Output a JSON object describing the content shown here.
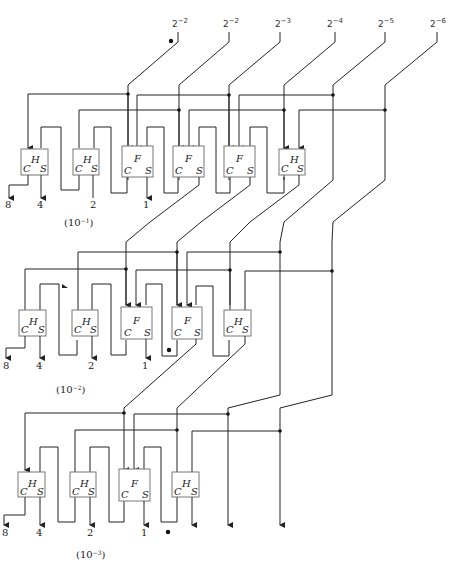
{
  "header": {
    "running_head": ""
  },
  "inputs": [
    {
      "label": "2^-2",
      "base": "2",
      "exp": "−2"
    },
    {
      "label": "2^-2",
      "base": "2",
      "exp": "−2"
    },
    {
      "label": "2^-3",
      "base": "2",
      "exp": "−3"
    },
    {
      "label": "2^-4",
      "base": "2",
      "exp": "−4"
    },
    {
      "label": "2^-5",
      "base": "2",
      "exp": "−5"
    },
    {
      "label": "2^-6",
      "base": "2",
      "exp": "−6"
    }
  ],
  "stages": [
    {
      "scale": "(10",
      "scale_exp": "−1",
      "scale_close": ")",
      "blocks": [
        "H",
        "H",
        "F",
        "F",
        "F",
        "H"
      ],
      "outputs": [
        "8",
        "4",
        "2",
        "1"
      ]
    },
    {
      "scale": "(10",
      "scale_exp": "−2",
      "scale_close": ")",
      "blocks": [
        "H",
        "H",
        "F",
        "F",
        "H"
      ],
      "outputs": [
        "8",
        "4",
        "2",
        "1"
      ]
    },
    {
      "scale": "(10",
      "scale_exp": "−3",
      "scale_close": ")",
      "blocks": [
        "H",
        "H",
        "F",
        "H"
      ],
      "outputs": [
        "8",
        "4",
        "2",
        "1"
      ]
    }
  ],
  "port_labels": {
    "carry": "C",
    "sum": "S"
  }
}
